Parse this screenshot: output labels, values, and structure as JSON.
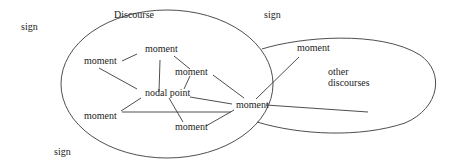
{
  "diagram": {
    "title": "Discourse",
    "other_region": {
      "line1": "other",
      "line2": "discourses"
    },
    "signs": [
      {
        "label": "sign",
        "x": 21,
        "y": 21
      },
      {
        "label": "sign",
        "x": 264,
        "y": 9
      },
      {
        "label": "sign",
        "x": 54,
        "y": 146
      }
    ],
    "nodal_point": {
      "label": "nodal point",
      "x": 145,
      "y": 87
    },
    "moments": [
      {
        "id": "m-left-top",
        "label": "moment",
        "x": 84,
        "y": 55
      },
      {
        "id": "m-top",
        "label": "moment",
        "x": 145,
        "y": 43
      },
      {
        "id": "m-middle",
        "label": "moment",
        "x": 175,
        "y": 66
      },
      {
        "id": "m-hub",
        "label": "moment",
        "x": 236,
        "y": 99
      },
      {
        "id": "m-left-bottom",
        "label": "moment",
        "x": 84,
        "y": 110
      },
      {
        "id": "m-bottom",
        "label": "moment",
        "x": 175,
        "y": 121
      },
      {
        "id": "m-other",
        "label": "moment",
        "x": 297,
        "y": 42
      }
    ],
    "colors": {
      "stroke": "#3a3a3a",
      "text": "#1c1c1c",
      "background": "#ffffff"
    }
  }
}
